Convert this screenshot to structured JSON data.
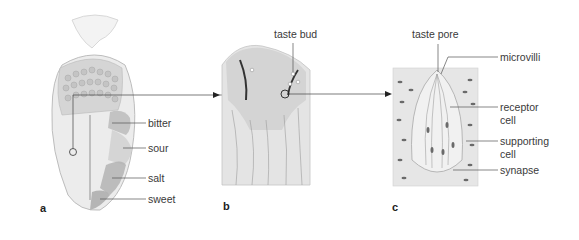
{
  "figure": {
    "panels": [
      {
        "id": "a",
        "letter": "a",
        "subject": "tongue",
        "labels": [
          "bitter",
          "sour",
          "salt",
          "sweet"
        ]
      },
      {
        "id": "b",
        "letter": "b",
        "subject": "papilla cross-section",
        "labels": [
          "taste bud"
        ]
      },
      {
        "id": "c",
        "letter": "c",
        "subject": "taste bud structure",
        "labels": [
          "taste pore",
          "microvilli",
          "receptor cell",
          "supporting cell",
          "synapse"
        ]
      }
    ],
    "label_text": {
      "bitter": "bitter",
      "sour": "sour",
      "salt": "salt",
      "sweet": "sweet",
      "taste_bud": "taste bud",
      "taste_pore": "taste pore",
      "microvilli": "microvilli",
      "receptor_1": "receptor",
      "receptor_2": "cell",
      "supporting_1": "supporting",
      "supporting_2": "cell",
      "synapse": "synapse"
    },
    "letters": {
      "a": "a",
      "b": "b",
      "c": "c"
    },
    "colors": {
      "region_shade": "#b5b5b5",
      "tongue_fill": "#ececec",
      "line": "#555555",
      "tissue": "#d9d9d9"
    }
  }
}
